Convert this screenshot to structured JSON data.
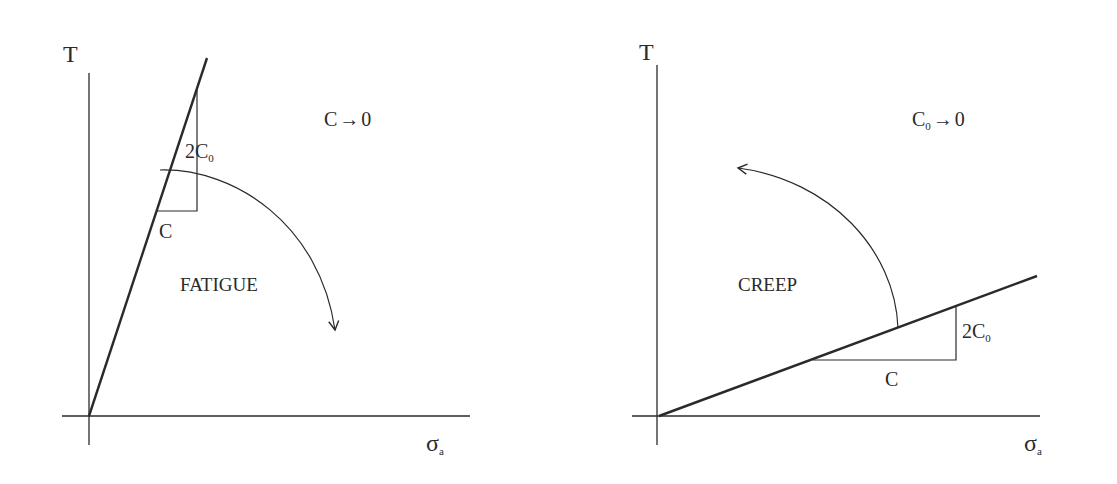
{
  "colors": {
    "ink": "#2a2a2a",
    "background": "#ffffff"
  },
  "left_diagram": {
    "y_axis_label": "T",
    "x_axis_label_main": "σ",
    "x_axis_label_sub": "a",
    "limit_label": "C",
    "limit_arrow": "→",
    "limit_target": "0",
    "region_label": "FATIGUE",
    "slope_rise_label_main": "2C",
    "slope_rise_label_sub": "0",
    "slope_run_label": "C",
    "arrow_direction": "clockwise (line rotates toward σa axis)"
  },
  "right_diagram": {
    "y_axis_label": "T",
    "x_axis_label_main": "σ",
    "x_axis_label_sub": "a",
    "limit_label_main": "C",
    "limit_label_sub": "0",
    "limit_arrow": "→",
    "limit_target": "0",
    "region_label": "CREEP",
    "slope_rise_label_main": "2C",
    "slope_rise_label_sub": "0",
    "slope_run_label": "C",
    "arrow_direction": "counter-clockwise (line rotates toward T axis)"
  }
}
